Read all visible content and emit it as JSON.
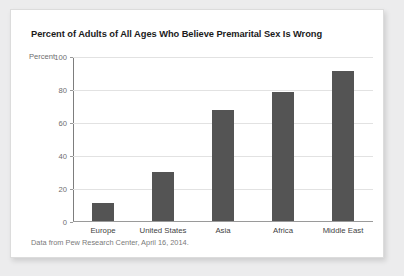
{
  "card": {
    "source_note": "Data from Pew Research Center, April 16, 2014."
  },
  "chart_data": {
    "type": "bar",
    "title": "Percent of Adults of All Ages Who Believe Premarital Sex Is Wrong",
    "xlabel": "",
    "ylabel": "Percent",
    "categories": [
      "Europe",
      "United States",
      "Asia",
      "Africa",
      "Middle East"
    ],
    "values": [
      11,
      30,
      67,
      78,
      91
    ],
    "ylim": [
      0,
      100
    ],
    "yticks": [
      0,
      20,
      40,
      60,
      80,
      100
    ],
    "ytick_labels": [
      "0",
      "20",
      "40",
      "60",
      "80",
      "100"
    ],
    "grid": true,
    "legend": "none",
    "bar_color": "#545454",
    "gridline_color": "#e2e2e2",
    "axis_color": "#9a9a9a"
  }
}
